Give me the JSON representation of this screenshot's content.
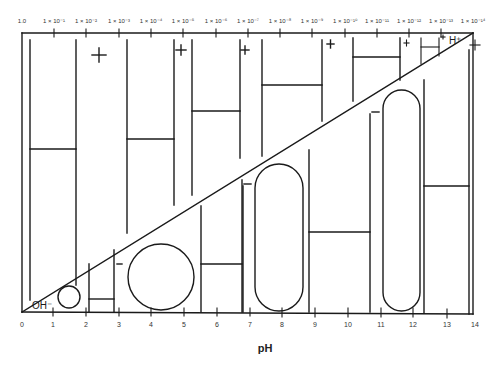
{
  "figure": {
    "title": "",
    "x_axis_title": "pH",
    "bottom_ticks": [
      "0",
      "1",
      "2",
      "3",
      "4",
      "5",
      "6",
      "7",
      "8",
      "9",
      "10",
      "11",
      "12",
      "13",
      "14"
    ],
    "top_ticks": [
      "1.0",
      "1 × 10⁻¹",
      "1 × 10⁻²",
      "1 × 10⁻³",
      "1 × 10⁻⁴",
      "1 × 10⁻⁵",
      "1 × 10⁻⁶",
      "1 × 10⁻⁷",
      "1 × 10⁻⁸",
      "1 × 10⁻⁹",
      "1 × 10⁻¹⁰",
      "1 × 10⁻¹¹",
      "1 × 10⁻¹²",
      "1 × 10⁻¹³",
      "1 × 10⁻¹⁴"
    ],
    "upper_region_label": "H⁺",
    "lower_region_label": "OH⁻",
    "plus_sign": "+",
    "minus_sign": "−",
    "ink_color": "#1a1a1a",
    "background": "#ffffff"
  }
}
